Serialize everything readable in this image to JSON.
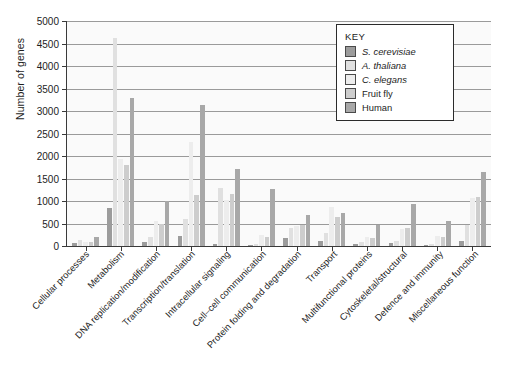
{
  "chart_data": {
    "type": "bar",
    "title": "",
    "xlabel": "",
    "ylabel": "Number of genes",
    "ylim": [
      0,
      5000
    ],
    "ytick_step": 500,
    "yticks": [
      "0",
      "500",
      "1000",
      "1500",
      "2000",
      "2500",
      "3000",
      "3500",
      "4000",
      "4500",
      "5000"
    ],
    "grid": true,
    "legend_position": "top-right",
    "legend_title": "KEY",
    "categories": [
      "Cellular processes",
      "Metabolism",
      "DNA replication/modification",
      "Transcription/translation",
      "Intracellular signaling",
      "Cell–cell communication",
      "Protein folding and degradation",
      "Transport",
      "Multifunctional proteins",
      "Cytoskeletal/structural",
      "Defence and immunity",
      "Miscellaneous function"
    ],
    "series": [
      {
        "name": "S. cerevisiae",
        "italic": true,
        "color": "#9c9c9c",
        "values": [
          60,
          850,
          90,
          230,
          50,
          10,
          180,
          120,
          50,
          60,
          10,
          120
        ]
      },
      {
        "name": "A. thaliana",
        "italic": true,
        "color": "#e0e0e0",
        "values": [
          130,
          4620,
          190,
          600,
          1300,
          50,
          390,
          300,
          90,
          120,
          40,
          470
        ]
      },
      {
        "name": "C. elegans",
        "italic": true,
        "color": "#ededed",
        "values": [
          100,
          1930,
          560,
          2320,
          1030,
          250,
          440,
          870,
          210,
          380,
          220,
          1070
        ]
      },
      {
        "name": "Fruit fly",
        "italic": false,
        "color": "#cdcdcd",
        "values": [
          90,
          1800,
          500,
          1130,
          1160,
          200,
          470,
          650,
          180,
          390,
          200,
          1100
        ]
      },
      {
        "name": "Human",
        "italic": false,
        "color": "#a8a8a8",
        "values": [
          190,
          3280,
          1000,
          3140,
          1720,
          1270,
          690,
          740,
          470,
          930,
          560,
          1650
        ]
      }
    ]
  }
}
